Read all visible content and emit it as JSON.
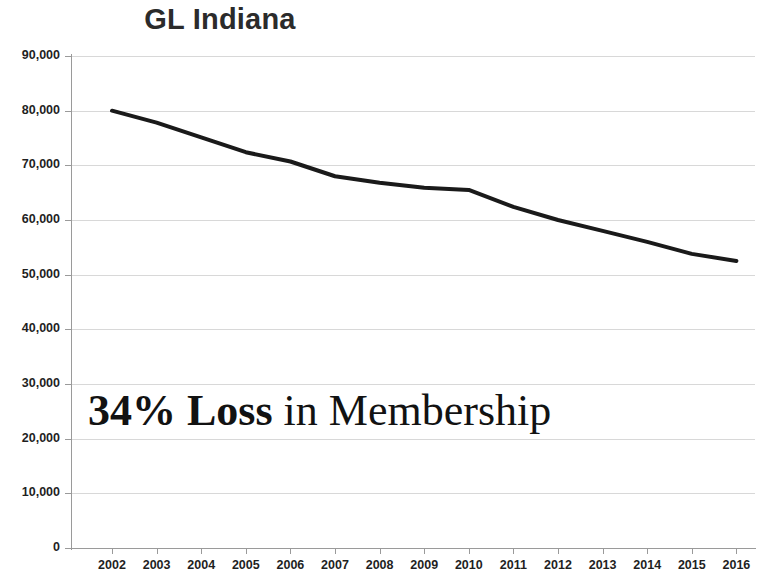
{
  "chart_data": {
    "type": "line",
    "title": "GL Indiana",
    "xlabel": "",
    "ylabel": "",
    "x": [
      2002,
      2003,
      2004,
      2005,
      2006,
      2007,
      2008,
      2009,
      2010,
      2011,
      2012,
      2013,
      2014,
      2015,
      2016
    ],
    "categories": [
      "2002",
      "2003",
      "2004",
      "2005",
      "2006",
      "2007",
      "2008",
      "2009",
      "2010",
      "2011",
      "2012",
      "2013",
      "2014",
      "2015",
      "2016"
    ],
    "values": [
      80000,
      77800,
      75100,
      72400,
      70700,
      68000,
      66800,
      65900,
      65500,
      62400,
      60000,
      58000,
      56000,
      53800,
      52500
    ],
    "series": [
      {
        "name": "Membership",
        "values": [
          80000,
          77800,
          75100,
          72400,
          70700,
          68000,
          66800,
          65900,
          65500,
          62400,
          60000,
          58000,
          56000,
          53800,
          52500
        ],
        "color": "#1a1a1a"
      }
    ],
    "ylim": [
      0,
      90000
    ],
    "xlim": [
      2002,
      2016
    ],
    "y_ticks": [
      0,
      10000,
      20000,
      30000,
      40000,
      50000,
      60000,
      70000,
      80000,
      90000
    ],
    "y_tick_labels": [
      "0",
      "10,000",
      "20,000",
      "30,000",
      "40,000",
      "50,000",
      "60,000",
      "70,000",
      "80,000",
      "90,000"
    ],
    "x_tick_labels": [
      "2002",
      "2003",
      "2004",
      "2005",
      "2006",
      "2007",
      "2008",
      "2009",
      "2010",
      "2011",
      "2012",
      "2013",
      "2014",
      "2015",
      "2016"
    ],
    "grid": true,
    "grid_axis": "y",
    "legend": false,
    "legend_position": "none",
    "annotations": [
      {
        "text": "34% Loss in Membership",
        "bold_text": "34% Loss",
        "regular_text": " in Membership"
      }
    ]
  },
  "annotation": {
    "bold_text": "34% Loss",
    "regular_text": " in Membership"
  },
  "colors": {
    "line": "#1a1a1a",
    "grid": "#d8d8d8",
    "axis": "#9a9a9a",
    "title": "#2b2b2b",
    "tick_label": "#1f1f1f",
    "annotation": "#121212",
    "background": "#ffffff"
  }
}
